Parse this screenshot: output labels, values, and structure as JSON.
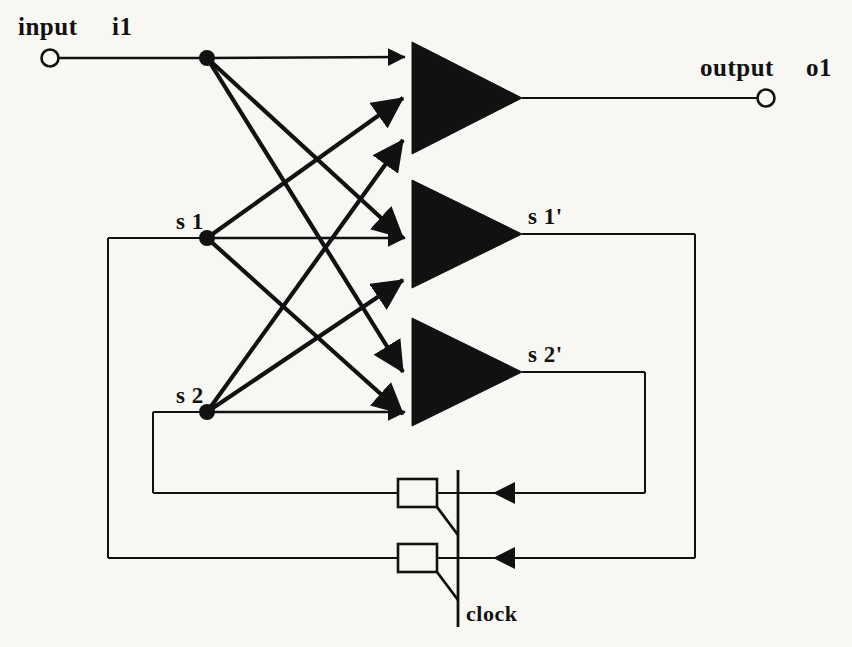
{
  "diagram": {
    "background_color": "#f8f7f4",
    "ink_color": "#111111",
    "labels": {
      "input_word": "input",
      "input_name": "i1",
      "output_word": "output",
      "output_name": "o1",
      "state1": "s 1",
      "state2": "s 2",
      "state1_next": "s 1'",
      "state2_next": "s 2'",
      "clock": "clock"
    },
    "terminals": [
      {
        "name": "input-terminal-i1",
        "kind": "open-circle",
        "x": 50,
        "y": 58,
        "r": 9
      },
      {
        "name": "output-terminal-o1",
        "kind": "open-circle",
        "x": 766,
        "y": 98,
        "r": 9
      }
    ],
    "junctions": [
      {
        "name": "junction-i1",
        "x": 207,
        "y": 58,
        "r": 8
      },
      {
        "name": "junction-s1",
        "x": 207,
        "y": 238,
        "r": 8
      },
      {
        "name": "junction-s2",
        "x": 207,
        "y": 412,
        "r": 8
      }
    ],
    "gates": [
      {
        "name": "gate-o1",
        "label": "o1",
        "x1": 412,
        "y1": 42,
        "x2": 522,
        "y2": 154,
        "out_x": 766,
        "out_y": 98
      },
      {
        "name": "gate-s1-next",
        "label": "s 1'",
        "x1": 412,
        "y1": 180,
        "x2": 522,
        "y2": 288,
        "out_x": 695,
        "out_y": 234
      },
      {
        "name": "gate-s2-next",
        "label": "s 2'",
        "x1": 412,
        "y1": 318,
        "x2": 522,
        "y2": 426,
        "out_x": 645,
        "out_y": 372
      }
    ],
    "state_elements": [
      {
        "name": "latch-s2",
        "x": 398,
        "y": 485,
        "w": 39,
        "h": 27
      },
      {
        "name": "latch-s1",
        "x": 398,
        "y": 547,
        "w": 39,
        "h": 27
      }
    ],
    "clock_line": {
      "x": 458,
      "y_top": 470,
      "y_bottom": 627
    },
    "gate_inputs": {
      "gate_o1": [
        57,
        98,
        140
      ],
      "gate_s1_next": [
        190,
        238,
        280
      ],
      "gate_s2_next": [
        330,
        372,
        414
      ]
    },
    "fanout_sources": [
      "i1",
      "s 1",
      "s 2"
    ],
    "feedback_paths": [
      {
        "name": "feedback-s1",
        "from": "s 1'",
        "right_x": 695,
        "down_y": 558,
        "left_x": 108,
        "up_y": 238
      },
      {
        "name": "feedback-s2",
        "from": "s 2'",
        "right_x": 645,
        "down_y": 493,
        "left_x": 153,
        "up_y": 412
      }
    ]
  }
}
